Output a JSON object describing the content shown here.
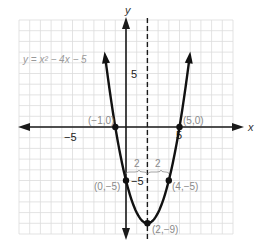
{
  "chart_data": {
    "type": "line",
    "title": "",
    "equation_label": "y = x² − 4x − 5",
    "xlabel": "x",
    "ylabel": "y",
    "xlim": [
      -10,
      10
    ],
    "ylim": [
      -10,
      10
    ],
    "grid": true,
    "grid_step": 1,
    "x_tick_labels": [
      {
        "value": -5,
        "label": "−5"
      },
      {
        "value": 5,
        "label": "5"
      }
    ],
    "y_tick_labels": [
      {
        "value": 5,
        "label": "5"
      },
      {
        "value": -5,
        "label": "−5"
      }
    ],
    "function": {
      "a": 1,
      "b": -4,
      "c": -5
    },
    "curve_domain": [
      -1.95,
      5.95
    ],
    "axis_of_symmetry": {
      "x": 2,
      "style": "dashed"
    },
    "points": [
      {
        "x": -1,
        "y": 0,
        "label": "(−1,0)"
      },
      {
        "x": 5,
        "y": 0,
        "label": "(5,0)"
      },
      {
        "x": 0,
        "y": -5,
        "label": "(0,−5)"
      },
      {
        "x": 4,
        "y": -5,
        "label": "(4,−5)"
      },
      {
        "x": 2,
        "y": -9,
        "label": "(2,−9)"
      }
    ],
    "annotations": [
      {
        "type": "brace",
        "from_x": 0,
        "to_x": 2,
        "y": -4.3,
        "label": "2"
      },
      {
        "type": "brace",
        "from_x": 2,
        "to_x": 4,
        "y": -4.3,
        "label": "2"
      }
    ],
    "series": [
      {
        "name": "y = x^2 - 4x - 5",
        "x": [
          -1,
          0,
          1,
          2,
          3,
          4,
          5
        ],
        "values": [
          0,
          -5,
          -8,
          -9,
          -8,
          -5,
          0
        ]
      }
    ]
  },
  "labels": {
    "equation": "y = x² − 4x − 5",
    "x_axis": "x",
    "y_axis": "y",
    "x_tick_neg5": "−5",
    "x_tick_5": "5",
    "y_tick_5": "5",
    "y_tick_neg5": "−5",
    "brace_left": "2",
    "brace_right": "2",
    "pt_neg1_0": "(−1,0)",
    "pt_5_0": "(5,0)",
    "pt_0_neg5": "(0,−5)",
    "pt_4_neg5": "(4,−5)",
    "pt_2_neg9": "(2,−9)"
  }
}
